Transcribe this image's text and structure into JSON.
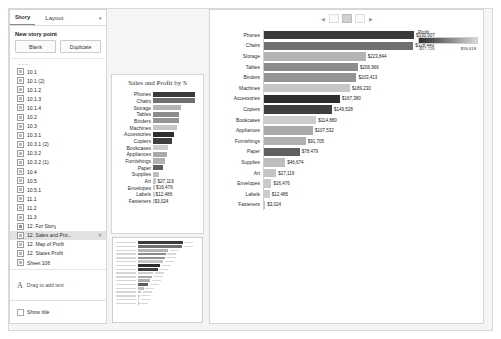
{
  "window": {
    "background": "#f5f5f5"
  },
  "story_panel": {
    "tabs": [
      {
        "label": "Story",
        "selected": true
      },
      {
        "label": "Layout",
        "selected": false
      }
    ],
    "caret_icon": "chevron-down-icon",
    "new_story_point_label": "New story point",
    "buttons": {
      "blank": "Blank",
      "duplicate": "Duplicate"
    },
    "items": [
      {
        "label": "10.1",
        "selected": false,
        "trail": ""
      },
      {
        "label": "10.1 (2)",
        "selected": false,
        "trail": ""
      },
      {
        "label": "10.1.2",
        "selected": false,
        "trail": ""
      },
      {
        "label": "10.1.3",
        "selected": false,
        "trail": ""
      },
      {
        "label": "10.1.4",
        "selected": false,
        "trail": ""
      },
      {
        "label": "10.2",
        "selected": false,
        "trail": ""
      },
      {
        "label": "10.3",
        "selected": false,
        "trail": ""
      },
      {
        "label": "10.3.1",
        "selected": false,
        "trail": ""
      },
      {
        "label": "10.3.1 (2)",
        "selected": false,
        "trail": ""
      },
      {
        "label": "10.3.2",
        "selected": false,
        "trail": ""
      },
      {
        "label": "10.3.2 (1)",
        "selected": false,
        "trail": ""
      },
      {
        "label": "10.4",
        "selected": false,
        "trail": ""
      },
      {
        "label": "10.5",
        "selected": false,
        "trail": ""
      },
      {
        "label": "10.5.1",
        "selected": false,
        "trail": ""
      },
      {
        "label": "11.1",
        "selected": false,
        "trail": ""
      },
      {
        "label": "11.2",
        "selected": false,
        "trail": ""
      },
      {
        "label": "11.3",
        "selected": false,
        "trail": ""
      },
      {
        "label": "12. For Story",
        "selected": false,
        "trail": ""
      },
      {
        "label": "12. Sales and Pro...",
        "selected": true,
        "trail": "✕"
      },
      {
        "label": "12. Map of Profit",
        "selected": false,
        "trail": ""
      },
      {
        "label": "12. States Profit",
        "selected": false,
        "trail": ""
      },
      {
        "label": "Sheet 106",
        "selected": false,
        "trail": ""
      }
    ],
    "drag_text_label": "Drag to add text",
    "drag_text_icon": "text-a-icon",
    "show_title_label": "Show title",
    "show_title_checked": false
  },
  "story_nav": {
    "prev_icon": "chevron-left-icon",
    "next_icon": "chevron-right-icon",
    "dots": 3,
    "active_index": 1
  },
  "thumbnail_card": {
    "title": "Sales and Profit by S"
  },
  "legend": {
    "title": "Profit",
    "min_label": "-$17,726",
    "max_label": "$55,618",
    "low_color": "#2b2b2b",
    "high_color": "#d9d9d9"
  },
  "chart_data": {
    "type": "bar",
    "title": "Sales and Profit by S",
    "xlabel": "",
    "ylabel": "",
    "orientation": "horizontal",
    "categories": [
      "Phones",
      "Chairs",
      "Storage",
      "Tables",
      "Binders",
      "Machines",
      "Accessories",
      "Copiers",
      "Bookcases",
      "Appliances",
      "Furnishings",
      "Paper",
      "Supplies",
      "Art",
      "Envelopes",
      "Labels",
      "Fasteners"
    ],
    "values": [
      330007,
      328449,
      223844,
      206966,
      203413,
      189230,
      167380,
      149528,
      114880,
      107532,
      91705,
      78479,
      46674,
      27119,
      16476,
      12486,
      3024
    ],
    "value_labels": [
      "$330,007",
      "$328,449",
      "$223,844",
      "$206,966",
      "$203,413",
      "$189,230",
      "$167,380",
      "$149,528",
      "$114,880",
      "$107,532",
      "$91,705",
      "$78,479",
      "$46,674",
      "$27,119",
      "$16,476",
      "$12,486",
      "$3,024"
    ],
    "profit": [
      55618,
      26590,
      21279,
      -17726,
      30222,
      3385,
      41937,
      55618,
      -3473,
      18138,
      13059,
      34054,
      26590,
      6528,
      6964,
      5546,
      949
    ],
    "color_field": "Profit",
    "color_labels": [
      "#3a3a3a",
      "#6f6f6f",
      "#b4b4b4",
      "#8c8c8c",
      "#949494",
      "#c6c6c6",
      "#2e2e2e",
      "#3f3f3f",
      "#cdcdcd",
      "#a9a9a9",
      "#b0b0b0",
      "#5f5f5f",
      "#bdbdbd",
      "#c4c4c4",
      "#c9c9c9",
      "#cccccc",
      "#bfbfbf"
    ],
    "legend_min": -17726,
    "legend_max": 55618,
    "grid": false,
    "legend_position": "top-right"
  },
  "mini_chart": {
    "value_labels_visible": [
      "$27",
      "$16,47",
      "$12,486",
      "$3,024"
    ]
  }
}
